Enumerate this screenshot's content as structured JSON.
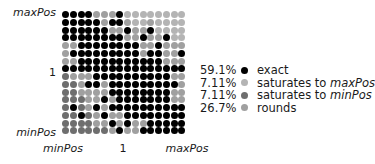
{
  "chart_data": {
    "type": "heatmap",
    "title": "",
    "xlabel": "",
    "ylabel": "",
    "x_tick_labels": [
      "minPos",
      "1",
      "maxPos"
    ],
    "y_tick_labels": [
      "maxPos",
      "1",
      "minPos"
    ],
    "grid_size": [
      16,
      16
    ],
    "categories": {
      "K": {
        "label": "exact",
        "color": "#000000",
        "percent": "59.1%"
      },
      "L": {
        "label": "saturates to maxPos",
        "color": "#b4b4b4",
        "percent": "7.11%"
      },
      "D": {
        "label": "saturates to minPos",
        "color": "#6e6e6e",
        "percent": "7.11%"
      },
      "R": {
        "label": "rounds",
        "color": "#a0a0a0",
        "percent": "26.7%"
      }
    },
    "rows": [
      "KKKKRRRKLLLLLLLL",
      "KKKKKRKKRLLRLLLL",
      "KKKKKKRRKRRKLLLL",
      "KKKKKKKKRRKRRKLL",
      "RRKKKKKKKKRRKRRR",
      "RKKKKKKKKKRKKRRK",
      "RRKKKKKKKKKKKRRR",
      "KKKKKKKKKKKKKKKK",
      "DRRRKKKKKKKKKKRR",
      "DDRKKRKKKKKKKKKR",
      "DDRRRRKKKKKKKKRR",
      "DDDRRKRKKKKKKKRR",
      "DKDRKRKKKKKKKKKK",
      "DDKDRKRRKKKKKKKK",
      "DDDDRRKRKRRKKKKK",
      "DDDDDDRKRRKKKKKK"
    ]
  },
  "axes": {
    "y_top": "maxPos",
    "y_mid": "1",
    "y_bottom": "minPos",
    "x_left": "minPos",
    "x_mid": "1",
    "x_right": "maxPos"
  },
  "legend": [
    {
      "percent": "59.1%",
      "text": "exact",
      "italic": "",
      "color": "#000000"
    },
    {
      "percent": "7.11%",
      "text": "saturates to ",
      "italic": "maxPos",
      "color": "#b4b4b4"
    },
    {
      "percent": "7.11%",
      "text": "saturates to ",
      "italic": "minPos",
      "color": "#6e6e6e"
    },
    {
      "percent": "26.7%",
      "text": "rounds",
      "italic": "",
      "color": "#a0a0a0"
    }
  ]
}
